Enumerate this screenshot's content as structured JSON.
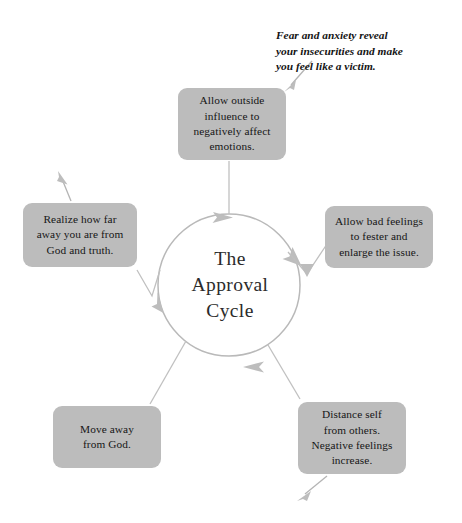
{
  "diagram": {
    "title": "The Approval Cycle",
    "center_label": "The\nApproval\nCycle",
    "colors": {
      "node_fill": "#bcbcbc",
      "ring_stroke": "#b9b9b9",
      "connector_stroke": "#bdbdbd",
      "text": "#161616",
      "center_text": "#2b2b2b",
      "background": "#ffffff"
    },
    "annotation": {
      "text": "Fear and anxiety reveal\nyour insecurities and make\nyou feel like a victim.",
      "arrow_name": "annotation-arrow"
    },
    "flow_direction": "clockwise",
    "nodes": [
      {
        "id": "top",
        "name": "node-allow-outside-influence",
        "text": "Allow outside\ninfluence to\nnegatively affect\nemotions."
      },
      {
        "id": "right",
        "name": "node-allow-bad-feelings",
        "text": "Allow bad feelings\nto fester and\nenlarge the issue."
      },
      {
        "id": "bottom-right",
        "name": "node-distance-self",
        "text": "Distance self\nfrom others.\nNegative feelings\nincrease."
      },
      {
        "id": "bottom-left",
        "name": "node-move-away-from-god",
        "text": "Move away\nfrom God."
      },
      {
        "id": "left",
        "name": "node-realize-how-far",
        "text": "Realize how far\naway you are from\nGod and truth."
      }
    ],
    "ring_arrowheads": [
      {
        "name": "ring-arrow-top",
        "position": "top"
      },
      {
        "name": "ring-arrow-right",
        "position": "right"
      },
      {
        "name": "ring-arrow-bottom",
        "position": "bottom"
      },
      {
        "name": "ring-arrow-left",
        "position": "left"
      }
    ],
    "outgoing_arrows": [
      {
        "name": "outgoing-arrow-left-box",
        "direction": "up-left"
      },
      {
        "name": "outgoing-arrow-bottom-right-box",
        "direction": "down-left"
      }
    ]
  }
}
